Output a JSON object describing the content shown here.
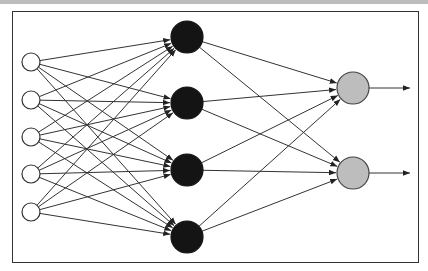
{
  "diagram": {
    "type": "neural-network",
    "layers": [
      {
        "name": "input",
        "count": 5,
        "fill": "#ffffff",
        "stroke": "#333333",
        "radius": 9,
        "x": 31,
        "ys": [
          62,
          100,
          137,
          174,
          212
        ]
      },
      {
        "name": "hidden",
        "count": 4,
        "fill": "#141414",
        "stroke": "#141414",
        "radius": 16,
        "x": 187,
        "ys": [
          37,
          103,
          170,
          237
        ]
      },
      {
        "name": "output",
        "count": 2,
        "fill": "#bdbdbd",
        "stroke": "#444444",
        "radius": 16,
        "x": 353,
        "ys": [
          88,
          173
        ]
      }
    ],
    "connections": "fully-connected",
    "output_arrows_end_x": 410,
    "edge_color": "#333333"
  }
}
